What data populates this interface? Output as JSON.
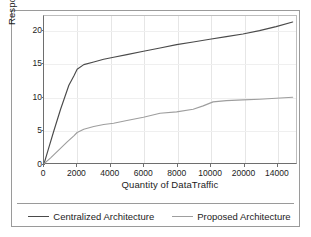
{
  "chart_data": {
    "type": "line",
    "title": "",
    "xlabel": "Quantity of DataTraffic",
    "ylabel": "Response Time (ms)",
    "xlim": [
      0,
      15200
    ],
    "ylim": [
      0,
      22.2
    ],
    "grid": true,
    "legend_position": "bottom",
    "x_tick_labels": [
      "0",
      "2000",
      "4000",
      "6000",
      "8000",
      "10000",
      "20000",
      "14000"
    ],
    "x_tick_values": [
      0,
      2000,
      4000,
      6000,
      8000,
      10000,
      12000,
      14000
    ],
    "y_tick_labels": [
      "0",
      "5",
      "10",
      "15",
      "20"
    ],
    "y_tick_values": [
      0,
      5,
      10,
      15,
      20
    ],
    "series": [
      {
        "name": "Centralized Architecture",
        "color": "#4a4a4a",
        "x": [
          0,
          250,
          600,
          1000,
          1500,
          1800,
          2000,
          2400,
          3000,
          3600,
          4200,
          5000,
          6000,
          7000,
          8000,
          9000,
          10000,
          11000,
          12000,
          13000,
          14000,
          15000
        ],
        "y": [
          0.0,
          2.1,
          5.0,
          8.2,
          11.8,
          13.2,
          14.2,
          14.9,
          15.3,
          15.7,
          16.0,
          16.4,
          16.9,
          17.4,
          17.9,
          18.3,
          18.7,
          19.1,
          19.5,
          20.0,
          20.6,
          21.3
        ]
      },
      {
        "name": "Proposed Architecture",
        "color": "#9e9e9e",
        "x": [
          0,
          400,
          900,
          1400,
          1800,
          2000,
          2400,
          3000,
          3600,
          4200,
          5000,
          6000,
          7000,
          8000,
          9000,
          9600,
          10200,
          11000,
          12000,
          13000,
          14000,
          15000
        ],
        "y": [
          0.0,
          0.9,
          2.1,
          3.3,
          4.2,
          4.7,
          5.2,
          5.6,
          5.9,
          6.1,
          6.5,
          7.0,
          7.6,
          7.8,
          8.2,
          8.7,
          9.3,
          9.5,
          9.6,
          9.7,
          9.85,
          10.0
        ]
      }
    ]
  },
  "axes": {
    "y_title": "Response Time (ms)",
    "x_title": "Quantity of DataTraffic",
    "y_ticks": [
      "20",
      "15",
      "10",
      "5",
      "0"
    ],
    "x_ticks": [
      "0",
      "2000",
      "4000",
      "6000",
      "8000",
      "10000",
      "20000",
      "14000"
    ]
  },
  "legend": {
    "entries": [
      {
        "label": "Centralized Architecture",
        "color": "#4a4a4a"
      },
      {
        "label": "Proposed Architecture",
        "color": "#9e9e9e"
      }
    ]
  }
}
